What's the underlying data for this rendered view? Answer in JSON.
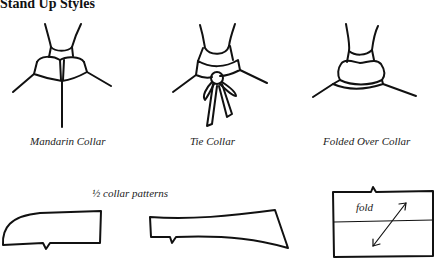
{
  "title": "Stand Up Styles",
  "collars": [
    {
      "label": "Mandarin Collar"
    },
    {
      "label": "Tie Collar"
    },
    {
      "label": "Folded Over Collar"
    }
  ],
  "patterns": {
    "label": "½ collar patterns",
    "fold_label": "fold"
  }
}
